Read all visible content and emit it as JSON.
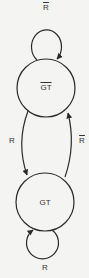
{
  "diagram": {
    "type": "state-diagram",
    "colors": {
      "stroke": "#2a2a2a",
      "text": "#333333",
      "background": "#f4f4f2"
    },
    "states": [
      {
        "id": "not_gt",
        "label": "GT",
        "negated": true
      },
      {
        "id": "gt",
        "label": "GT",
        "negated": false
      }
    ],
    "transitions": [
      {
        "from": "not_gt",
        "to": "not_gt",
        "label": "R",
        "negated": true
      },
      {
        "from": "not_gt",
        "to": "gt",
        "label": "R",
        "negated": false
      },
      {
        "from": "gt",
        "to": "not_gt",
        "label": "R",
        "negated": true
      },
      {
        "from": "gt",
        "to": "gt",
        "label": "R",
        "negated": false
      }
    ]
  }
}
